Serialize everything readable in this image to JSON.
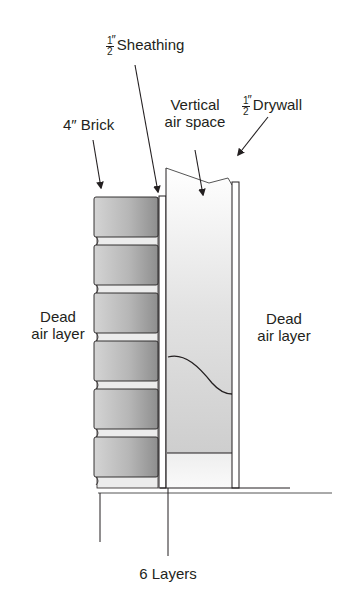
{
  "labels": {
    "sheathing": {
      "fraction_num": "1",
      "fraction_den": "2",
      "inch_mark": "″",
      "text": "Sheathing"
    },
    "drywall": {
      "fraction_num": "1",
      "fraction_den": "2",
      "inch_mark": "″",
      "text": "Drywall"
    },
    "brick": {
      "text": "4″ Brick"
    },
    "vertical_air_space": {
      "line1": "Vertical",
      "line2": "air space"
    },
    "dead_air_left": {
      "line1": "Dead",
      "line2": "air layer"
    },
    "dead_air_right": {
      "line1": "Dead",
      "line2": "air layer"
    },
    "caption": "6 Layers"
  },
  "colors": {
    "line": "#231f20",
    "brick_dark": "#9a9a9a",
    "brick_light": "#d8d8d8",
    "air_space_dark": "#c8c8c8",
    "air_space_light": "#f7f7f7",
    "mortar": "#ececec"
  },
  "layers": [
    "Dead air layer (outside)",
    "4″ Brick",
    "1/2″ Sheathing",
    "Vertical air space",
    "1/2″ Drywall",
    "Dead air layer (inside)"
  ],
  "brick_count": 6
}
